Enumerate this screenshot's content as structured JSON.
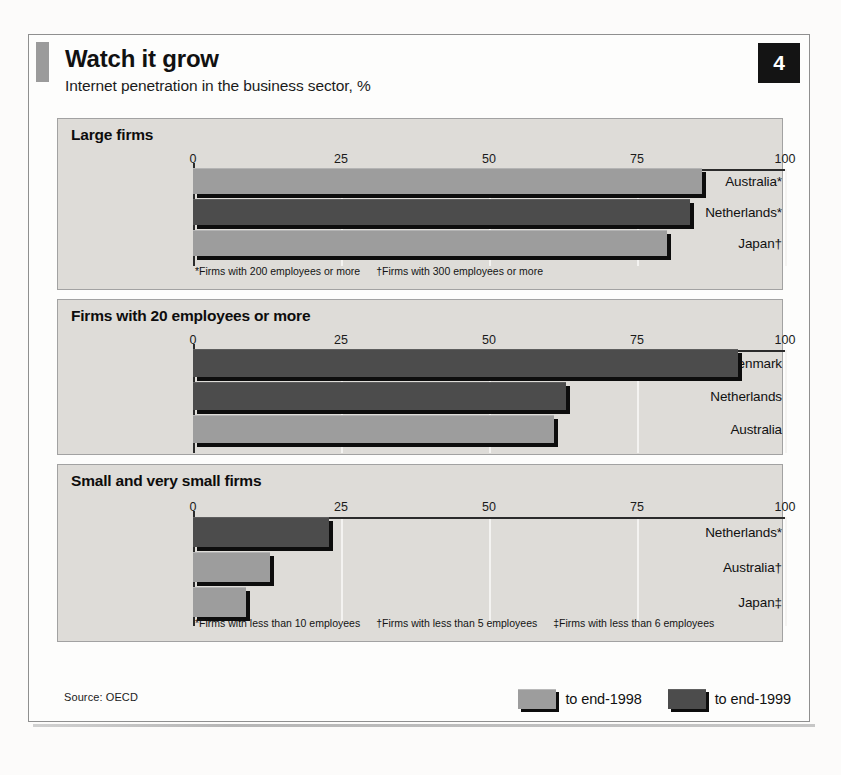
{
  "figure": {
    "title": "Watch it grow",
    "subtitle": "Internet penetration in the business sector, %",
    "badge": "4",
    "source": "Source: OECD",
    "legend": [
      {
        "label": "to end-1998",
        "color": "#9d9d9d"
      },
      {
        "label": "to end-1999",
        "color": "#4c4c4c"
      }
    ]
  },
  "axis": {
    "ticks": [
      "0",
      "25",
      "50",
      "75",
      "100"
    ],
    "min": 0,
    "max": 100
  },
  "panels": [
    {
      "title": "Large firms",
      "footnotes": [
        "*Firms with 200 employees or more",
        "†Firms with 300 employees or more"
      ],
      "rows": [
        {
          "label": "Australia*",
          "value": 86,
          "series": "to end-1998"
        },
        {
          "label": "Netherlands*",
          "value": 84,
          "series": "to end-1999"
        },
        {
          "label": "Japan†",
          "value": 80,
          "series": "to end-1998"
        }
      ]
    },
    {
      "title": "Firms with 20 employees or more",
      "footnotes": [],
      "rows": [
        {
          "label": "Denmark",
          "value": 92,
          "series": "to end-1999"
        },
        {
          "label": "Netherlands",
          "value": 63,
          "series": "to end-1999"
        },
        {
          "label": "Australia",
          "value": 61,
          "series": "to end-1998"
        }
      ]
    },
    {
      "title": "Small and very small firms",
      "footnotes": [
        "*Firms with less than 10 employees",
        "†Firms with less than 5 employees",
        "‡Firms with less than 6 employees"
      ],
      "rows": [
        {
          "label": "Netherlands*",
          "value": 23,
          "series": "to end-1999"
        },
        {
          "label": "Australia†",
          "value": 13,
          "series": "to end-1998"
        },
        {
          "label": "Japan‡",
          "value": 9,
          "series": "to end-1998"
        }
      ]
    }
  ],
  "chart_data": {
    "type": "bar",
    "title": "Watch it grow",
    "subtitle": "Internet penetration in the business sector, %",
    "xlabel": "",
    "ylabel": "",
    "xlim": [
      0,
      100
    ],
    "grid": true,
    "orientation": "horizontal",
    "legend_position": "bottom-right",
    "legend": [
      "to end-1998",
      "to end-1999"
    ],
    "tick_labels": [
      "0",
      "25",
      "50",
      "75",
      "100"
    ],
    "source": "Source: OECD",
    "panels": [
      {
        "title": "Large firms",
        "categories": [
          "Australia*",
          "Netherlands*",
          "Japan†"
        ],
        "values": [
          86,
          84,
          80
        ],
        "series_of_bar": [
          "to end-1998",
          "to end-1999",
          "to end-1998"
        ],
        "annotations": [
          "*Firms with 200 employees or more",
          "†Firms with 300 employees or more"
        ]
      },
      {
        "title": "Firms with 20 employees or more",
        "categories": [
          "Denmark",
          "Netherlands",
          "Australia"
        ],
        "values": [
          92,
          63,
          61
        ],
        "series_of_bar": [
          "to end-1999",
          "to end-1999",
          "to end-1998"
        ],
        "annotations": []
      },
      {
        "title": "Small and very small firms",
        "categories": [
          "Netherlands*",
          "Australia†",
          "Japan‡"
        ],
        "values": [
          23,
          13,
          9
        ],
        "series_of_bar": [
          "to end-1999",
          "to end-1998",
          "to end-1998"
        ],
        "annotations": [
          "*Firms with less than 10 employees",
          "†Firms with less than 5 employees",
          "‡Firms with less than 6 employees"
        ]
      }
    ]
  }
}
